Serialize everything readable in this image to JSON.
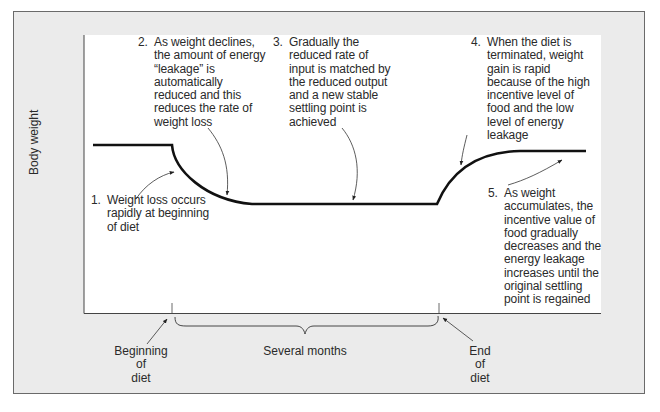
{
  "figure": {
    "y_axis_label": "Body weight",
    "x_markers": {
      "beginning": "Beginning\nof\ndiet",
      "end": "End\nof\ndiet",
      "span": "Several months"
    },
    "annotations": [
      {
        "num": "1.",
        "text": "Weight loss occurs\nrapidly at beginning\nof diet"
      },
      {
        "num": "2.",
        "text": "As weight declines,\nthe amount of energy\n“leakage” is\nautomatically\nreduced and this\nreduces the rate of\nweight loss"
      },
      {
        "num": "3.",
        "text": "Gradually the\nreduced rate of\ninput is matched by\nthe reduced output\nand a new stable\nsettling point is\nachieved"
      },
      {
        "num": "4.",
        "text": "When the diet is\nterminated, weight\ngain is rapid\nbecause of the high\nincentive level of\nfood and the low\nlevel of energy\nleakage"
      },
      {
        "num": "5.",
        "text": "As weight\naccumulates, the\nincentive value of\nfood gradually\ndecreases and the\nenergy leakage\nincreases until the\noriginal settling\npoint is regained"
      }
    ],
    "colors": {
      "frame_bg": "#ebebeb",
      "plot_bg": "#ffffff",
      "curve": "#111111",
      "text": "#2a2a2a"
    }
  }
}
